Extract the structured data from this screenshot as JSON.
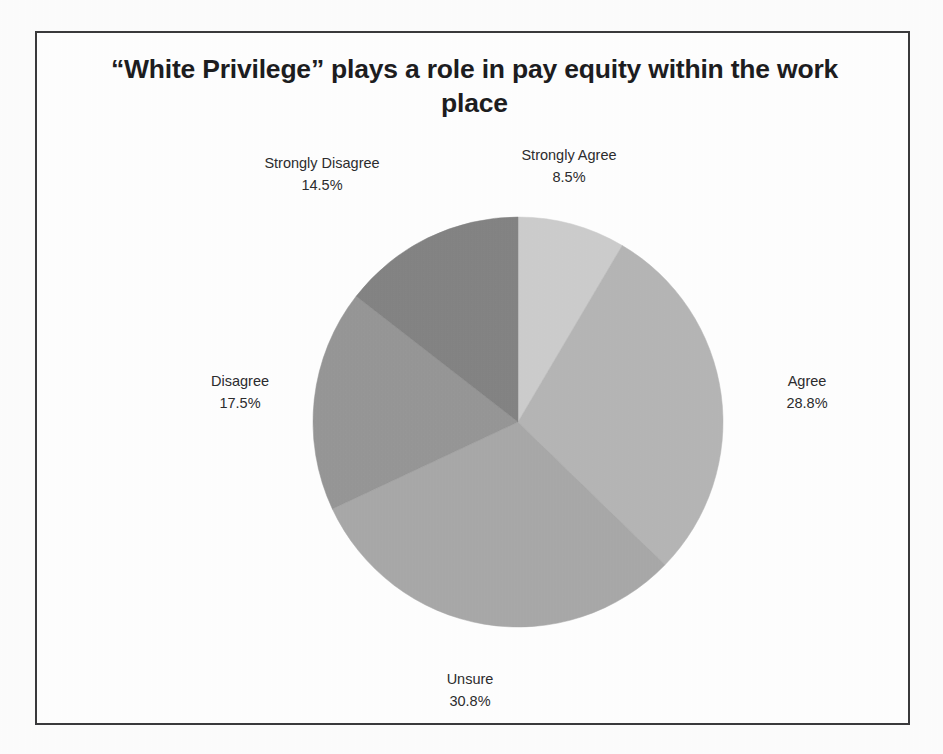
{
  "figure": {
    "frame_border_color": "#3a3a3c",
    "background_color": "#ffffff",
    "page_background_color": "#fdfdfd",
    "text_color": "#2c2c2e"
  },
  "chart_data": {
    "type": "pie",
    "title": "“White Privilege” plays a role in pay equity within the work place",
    "xlabel": "",
    "ylabel": "",
    "legend": "none",
    "grid": false,
    "labels_show_percent": true,
    "start_angle_deg": 0,
    "direction": "clockwise",
    "categories": [
      "Strongly Agree",
      "Agree",
      "Unsure",
      "Disagree",
      "Strongly Disagree"
    ],
    "values": [
      8.5,
      28.8,
      30.8,
      17.5,
      14.5
    ],
    "colors": [
      "#cdcdcd",
      "#b6b6b6",
      "#a9a9a9",
      "#979797",
      "#848484"
    ],
    "slices": [
      {
        "label": "Strongly Agree",
        "percent": "8.5%",
        "value": 8.5,
        "color": "#cdcdcd"
      },
      {
        "label": "Agree",
        "percent": "28.8%",
        "value": 28.8,
        "color": "#b6b6b6"
      },
      {
        "label": "Unsure",
        "percent": "30.8%",
        "value": 30.8,
        "color": "#a9a9a9"
      },
      {
        "label": "Disagree",
        "percent": "17.5%",
        "value": 17.5,
        "color": "#979797"
      },
      {
        "label": "Strongly Disagree",
        "percent": "14.5%",
        "value": 14.5,
        "color": "#848484"
      }
    ]
  },
  "geometry": {
    "center_x": 481,
    "center_y": 389,
    "radius": 205
  }
}
